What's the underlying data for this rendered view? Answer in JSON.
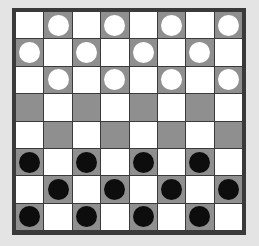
{
  "game": {
    "name": "Checkers",
    "board_size": 8,
    "colors": {
      "light_square": "#ffffff",
      "dark_square": "#8f8f8f",
      "frame": "#3a3a3a",
      "white_piece": "#ffffff",
      "black_piece": "#0d0d0d"
    },
    "board": [
      [
        "",
        "W",
        "",
        "W",
        "",
        "W",
        "",
        "W"
      ],
      [
        "W",
        "",
        "W",
        "",
        "W",
        "",
        "W",
        ""
      ],
      [
        "",
        "W",
        "",
        "W",
        "",
        "W",
        "",
        "W"
      ],
      [
        "",
        "",
        "",
        "",
        "",
        "",
        "",
        ""
      ],
      [
        "",
        "",
        "",
        "",
        "",
        "",
        "",
        ""
      ],
      [
        "B",
        "",
        "B",
        "",
        "B",
        "",
        "B",
        ""
      ],
      [
        "",
        "B",
        "",
        "B",
        "",
        "B",
        "",
        "B"
      ],
      [
        "B",
        "",
        "B",
        "",
        "B",
        "",
        "B",
        ""
      ]
    ],
    "piece_counts": {
      "white": 12,
      "black": 12
    }
  }
}
